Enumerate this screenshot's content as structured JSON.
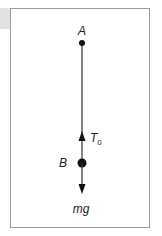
{
  "diagram": {
    "type": "free-body diagram",
    "point_top": {
      "label": "A"
    },
    "point_mass": {
      "label": "B"
    },
    "forces": [
      {
        "name": "tension",
        "label": "T",
        "subscript": "0",
        "direction": "up"
      },
      {
        "name": "weight",
        "label": "mg",
        "direction": "down"
      }
    ],
    "colors": {
      "line": "#333333",
      "frame": "#9a9a9a",
      "tab": "#e2e2e2"
    }
  }
}
